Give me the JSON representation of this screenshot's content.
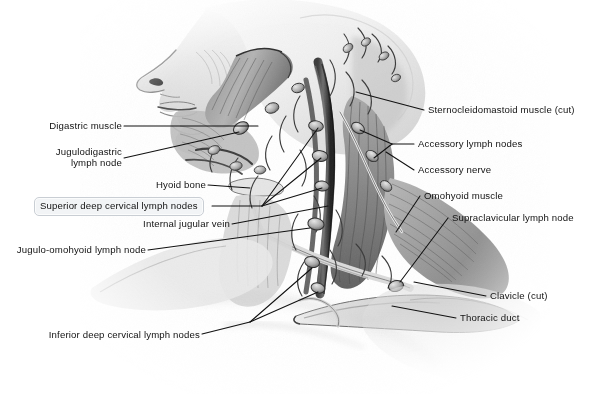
{
  "figure": {
    "background_color": "#ffffff",
    "ink_color": "#1a1a1a",
    "style": "grayscale pencil / airbrush medical illustration"
  },
  "labels": {
    "digastric_muscle": "Digastric muscle",
    "jugulodigastric_lymph_node": "Jugulodigastric\nlymph node",
    "jugulodigastric_line1": "Jugulodigastric",
    "jugulodigastric_line2": "lymph node",
    "hyoid_bone": "Hyoid bone",
    "superior_deep_cervical_lymph_nodes": "Superior deep cervical lymph nodes",
    "internal_jugular_vein": "Internal jugular vein",
    "jugulo_omohyoid_lymph_node": "Jugulo-omohyoid lymph node",
    "inferior_deep_cervical_lymph_nodes": "Inferior deep cervical lymph nodes",
    "sternocleidomastoid_muscle_cut": "Sternocleidomastoid muscle (cut)",
    "accessory_lymph_nodes": "Accessory lymph nodes",
    "accessory_nerve": "Accessory nerve",
    "omohyoid_muscle": "Omohyoid muscle",
    "supraclavicular_lymph_node": "Supraclavicular lymph node",
    "clavicle_cut": "Clavicle (cut)",
    "thoracic_duct": "Thoracic duct"
  },
  "highlight": {
    "target": "superior_deep_cervical_lymph_nodes",
    "fill": "#f2f4f6",
    "border": "#c9ced4",
    "shape": "rounded-rectangle"
  }
}
